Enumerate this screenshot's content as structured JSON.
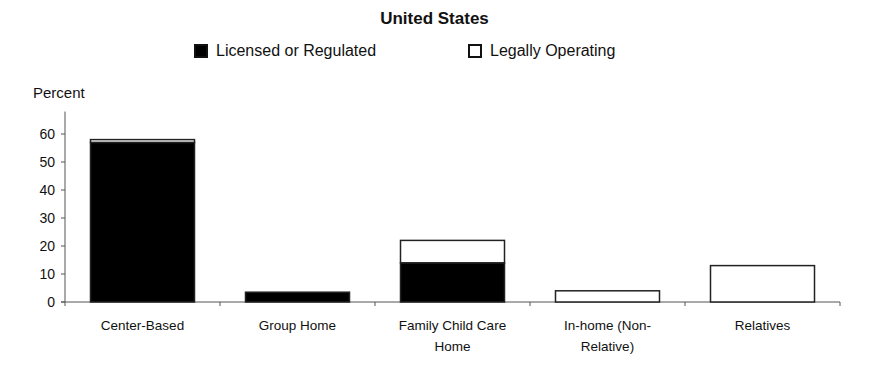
{
  "chart_data": {
    "type": "bar",
    "stacked": true,
    "title": "United States",
    "xlabel": "",
    "ylabel": "Percent",
    "ylim": [
      0,
      60
    ],
    "yticks": [
      0,
      10,
      20,
      30,
      40,
      50,
      60
    ],
    "grid": false,
    "legend_position": "top",
    "categories": [
      "Center-Based",
      "Group Home",
      "Family Child Care Home",
      "In-home (Non-Relative)",
      "Relatives"
    ],
    "category_labels": [
      [
        "Center-Based"
      ],
      [
        "Group Home"
      ],
      [
        "Family Child Care",
        "Home"
      ],
      [
        "In-home (Non-",
        "Relative)"
      ],
      [
        "Relatives"
      ]
    ],
    "series": [
      {
        "name": "Licensed or Regulated",
        "color": "#000000",
        "values": [
          57,
          3.5,
          14,
          0,
          0
        ]
      },
      {
        "name": "Legally Operating",
        "color": "#ffffff",
        "values": [
          1,
          0,
          8,
          4,
          13
        ]
      }
    ]
  }
}
